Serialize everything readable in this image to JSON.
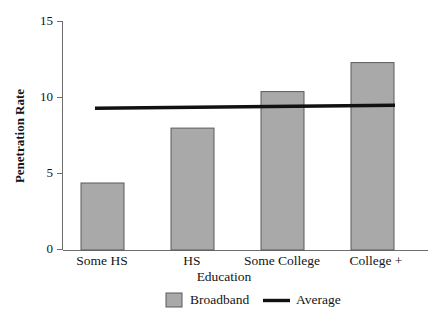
{
  "chart_data": {
    "type": "bar",
    "title": "",
    "subtitle": "",
    "xlabel": "Education",
    "ylabel": "Penetration Rate",
    "categories": [
      "Some HS",
      "HS",
      "Some College",
      "College +"
    ],
    "series": [
      {
        "name": "Broadband",
        "type": "bar",
        "color": "#a9a9a9",
        "values": [
          4.4,
          8.0,
          10.4,
          12.3
        ]
      },
      {
        "name": "Average",
        "type": "line",
        "color": "#111111",
        "values": [
          9.3,
          9.4,
          9.45,
          9.5
        ]
      }
    ],
    "ylim": [
      0,
      15
    ],
    "yticks": [
      0,
      5,
      10,
      15
    ],
    "ytick_labels": [
      "0",
      "5",
      "10",
      "15"
    ],
    "grid": false,
    "legend_position": "bottom",
    "legend": [
      {
        "label": "Broadband",
        "marker": "square",
        "color": "#a9a9a9"
      },
      {
        "label": "Average",
        "marker": "line",
        "color": "#111111"
      }
    ]
  },
  "axes": {
    "y_title": "Penetration Rate",
    "x_title": "Education",
    "y_ticks": [
      {
        "value": "15"
      },
      {
        "value": "10"
      },
      {
        "value": "5"
      },
      {
        "value": "0"
      }
    ],
    "x_categories": [
      {
        "label": "Some HS"
      },
      {
        "label": "HS"
      },
      {
        "label": "Some College"
      },
      {
        "label": "College +"
      }
    ]
  },
  "legend": {
    "broadband_label": "Broadband",
    "average_label": "Average"
  },
  "colors": {
    "bar_fill": "#a9a9a9",
    "bar_stroke": "#5a5a5a",
    "average_line": "#111111",
    "axis": "#6e6e6e",
    "text": "#141414",
    "background": "#ffffff"
  }
}
